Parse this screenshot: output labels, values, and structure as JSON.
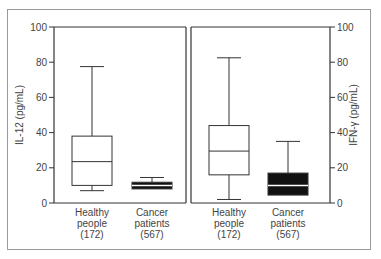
{
  "chart_data": [
    {
      "type": "box",
      "title": "",
      "ylabel": "IL-12 (pg/mL)",
      "xlabel": "",
      "ylim": [
        0,
        100
      ],
      "yticks": [
        0,
        20,
        40,
        60,
        80,
        100
      ],
      "axis_side": "left",
      "categories": [
        {
          "label_lines": [
            "Healthy",
            "people",
            "(172)"
          ],
          "n": 172
        },
        {
          "label_lines": [
            "Cancer",
            "patients",
            "(567)"
          ],
          "n": 567
        }
      ],
      "series": [
        {
          "name": "Healthy people",
          "whisker_low": 7,
          "q1": 10,
          "median": 23.5,
          "q3": 38,
          "whisker_high": 77.5,
          "fill": "none"
        },
        {
          "name": "Cancer patients",
          "whisker_low": 8,
          "q1": 8,
          "median": 10,
          "q3": 11.8,
          "whisker_high": 14.5,
          "fill": "#111111"
        }
      ]
    },
    {
      "type": "box",
      "title": "",
      "ylabel": "IFN-γ (pg/mL)",
      "xlabel": "",
      "ylim": [
        0,
        100
      ],
      "yticks": [
        0,
        20,
        40,
        60,
        80,
        100
      ],
      "axis_side": "right",
      "categories": [
        {
          "label_lines": [
            "Healthy",
            "people",
            "(172)"
          ],
          "n": 172
        },
        {
          "label_lines": [
            "Cancer",
            "patients",
            "(567)"
          ],
          "n": 567
        }
      ],
      "series": [
        {
          "name": "Healthy people",
          "whisker_low": 2,
          "q1": 16,
          "median": 29.5,
          "q3": 44,
          "whisker_high": 82.5,
          "fill": "none"
        },
        {
          "name": "Cancer patients",
          "whisker_low": 4.5,
          "q1": 4.5,
          "median": 10,
          "q3": 17,
          "whisker_high": 35,
          "fill": "#111111"
        }
      ]
    }
  ],
  "colors": {
    "axis": "#333333",
    "box_stroke": "#333333",
    "filled_box": "#111111",
    "frame": "#9a9a9a"
  }
}
